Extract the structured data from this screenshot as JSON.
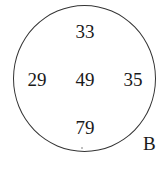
{
  "figure": {
    "top": "33",
    "left": "29",
    "center": "49",
    "right": "35",
    "bottom": "79",
    "label": "B"
  }
}
